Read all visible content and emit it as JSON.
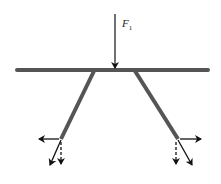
{
  "diagram": {
    "type": "force-diagram",
    "applied_force": {
      "label_symbol": "F",
      "label_subscript": "1",
      "direction": "down"
    },
    "colors": {
      "beam": "#555555",
      "arrow": "#111111",
      "background": "#ffffff"
    },
    "components": {
      "left_foot": [
        "horizontal-left (solid)",
        "vertical-down (dashed)",
        "diagonal along leg (solid)"
      ],
      "right_foot": [
        "horizontal-right (solid)",
        "vertical-down (dashed)",
        "diagonal along leg (solid)"
      ]
    }
  }
}
